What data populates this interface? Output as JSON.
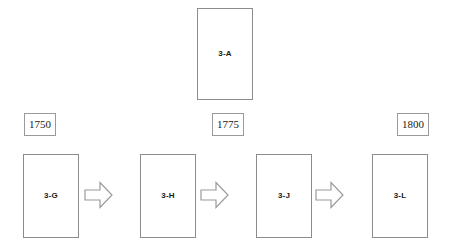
{
  "diagram": {
    "type": "process-flow",
    "canvas": {
      "width": 449,
      "height": 251,
      "background": "#ffffff"
    },
    "colors": {
      "box_border": "#8c8c8c",
      "year_box_border": "#9a9a9a",
      "arrow_stroke": "#9a9a9a",
      "box_fill": "#ffffff",
      "text": "#1a1a1a"
    },
    "top_node": {
      "id": "3-A",
      "label": "3-A",
      "x": 197,
      "y": 8,
      "width": 56,
      "height": 92
    },
    "year_markers": [
      {
        "id": "year-1750",
        "label": "1750",
        "x": 24,
        "y": 113,
        "width": 32,
        "height": 23
      },
      {
        "id": "year-1775",
        "label": "1775",
        "x": 212,
        "y": 113,
        "width": 32,
        "height": 23
      },
      {
        "id": "year-1800",
        "label": "1800",
        "x": 397,
        "y": 113,
        "width": 32,
        "height": 23
      }
    ],
    "process_nodes": [
      {
        "id": "3-G",
        "label": "3-G",
        "x": 23,
        "y": 154,
        "width": 56,
        "height": 84
      },
      {
        "id": "3-H",
        "label": "3-H",
        "x": 140,
        "y": 154,
        "width": 56,
        "height": 84
      },
      {
        "id": "3-J",
        "label": "3-J",
        "x": 256,
        "y": 154,
        "width": 56,
        "height": 84
      },
      {
        "id": "3-L",
        "label": "3-L",
        "x": 372,
        "y": 154,
        "width": 56,
        "height": 84
      }
    ],
    "arrows": [
      {
        "id": "arrow-g-to-h",
        "from": "3-G",
        "to": "3-H",
        "direction": "right",
        "x": 84,
        "y": 181,
        "width": 29,
        "height": 28
      },
      {
        "id": "arrow-h-to-j",
        "from": "3-H",
        "to": "3-J",
        "direction": "right",
        "x": 200,
        "y": 181,
        "width": 29,
        "height": 28
      },
      {
        "id": "arrow-j-to-l",
        "from": "3-J",
        "to": "3-L",
        "direction": "right",
        "x": 315,
        "y": 181,
        "width": 29,
        "height": 28
      }
    ]
  }
}
